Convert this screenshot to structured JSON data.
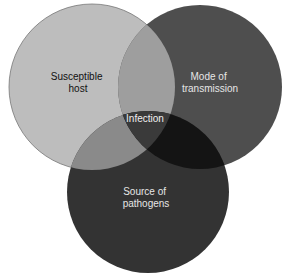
{
  "diagram": {
    "type": "venn",
    "sets": [
      {
        "id": "host",
        "label_lines": [
          "Susceptible",
          "host"
        ],
        "color": "#bdbdbd",
        "text_color": "#111111"
      },
      {
        "id": "transmission",
        "label_lines": [
          "Mode of",
          "transmission"
        ],
        "color": "#4e4e4e",
        "text_color": "#e6e6e6"
      },
      {
        "id": "pathogens",
        "label_lines": [
          "Source of",
          "pathogens"
        ],
        "color": "#333333",
        "text_color": "#e6e6e6"
      }
    ],
    "intersections": {
      "host_transmission": "#9e9e9e",
      "host_pathogens": "#8a8a8a",
      "transmission_pathogens": "#141414",
      "all": {
        "label": "Infection",
        "color": "#3a3a3a",
        "text_color": "#f0f0f0"
      }
    }
  }
}
